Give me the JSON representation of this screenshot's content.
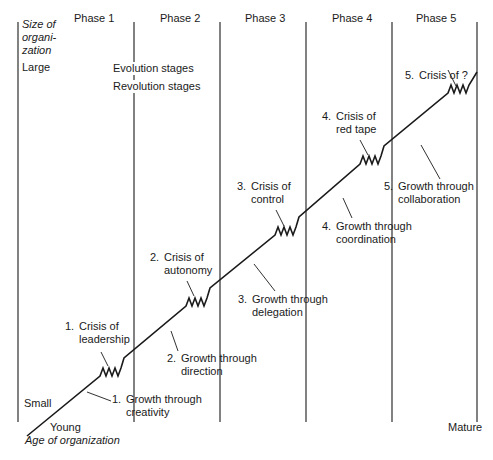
{
  "axes": {
    "y_label": [
      "Size of",
      "organi-",
      "zation"
    ],
    "y_high": "Large",
    "y_low": "Small",
    "x_low": "Young",
    "x_high": "Mature",
    "x_label": "Age of organization"
  },
  "phases": [
    "Phase 1",
    "Phase 2",
    "Phase 3",
    "Phase 4",
    "Phase 5"
  ],
  "legend": {
    "evolution": "Evolution stages",
    "revolution": "Revolution stages"
  },
  "evolution_stages": [
    {
      "num": "1.",
      "line1": "Growth through",
      "line2": "creativity"
    },
    {
      "num": "2.",
      "line1": "Growth through",
      "line2": "direction"
    },
    {
      "num": "3.",
      "line1": "Growth through",
      "line2": "delegation"
    },
    {
      "num": "4.",
      "line1": "Growth through",
      "line2": "coordination"
    },
    {
      "num": "5.",
      "line1": "Growth through",
      "line2": "collaboration"
    }
  ],
  "revolution_stages": [
    {
      "num": "1.",
      "line1": "Crisis of",
      "line2": "leadership"
    },
    {
      "num": "2.",
      "line1": "Crisis of",
      "line2": "autonomy"
    },
    {
      "num": "3.",
      "line1": "Crisis of",
      "line2": "control"
    },
    {
      "num": "4.",
      "line1": "Crisis of",
      "line2": "red tape"
    },
    {
      "num": "5.",
      "line1": "Crisis of ?",
      "line2": ""
    }
  ],
  "colors": {
    "line": "#1a1a1a",
    "background": "#ffffff"
  }
}
